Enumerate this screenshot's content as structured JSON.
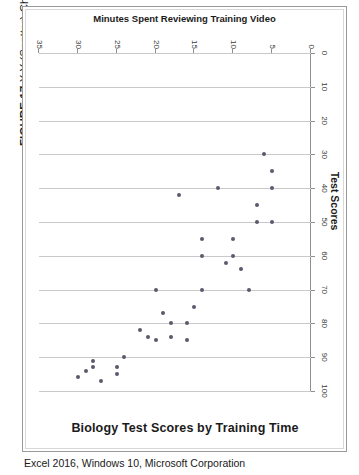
{
  "figure": {
    "label": "FIGURE 17",
    "caption": "X Y (Scatter) Chart"
  },
  "source": "Excel 2016, Windows 10, Microsoft Corporation",
  "chart_data": {
    "type": "scatter",
    "title": "Biology Test Scores by Training Time",
    "xlabel": "Test Scores",
    "ylabel": "Minutes Spent Reviewing Training Video",
    "xlim": [
      0,
      100
    ],
    "ylim": [
      0,
      35
    ],
    "xticks": [
      0,
      10,
      20,
      30,
      40,
      50,
      60,
      70,
      80,
      90,
      100
    ],
    "yticks": [
      0,
      5,
      10,
      15,
      20,
      25,
      30,
      35
    ],
    "grid": "vertical",
    "legend": "none",
    "marker": "diamond",
    "marker_color": "#5a5a6e",
    "y_axis_inverted": true,
    "points": [
      {
        "x": 30,
        "y": 6
      },
      {
        "x": 35,
        "y": 5
      },
      {
        "x": 40,
        "y": 5
      },
      {
        "x": 50,
        "y": 5
      },
      {
        "x": 45,
        "y": 7
      },
      {
        "x": 50,
        "y": 7
      },
      {
        "x": 70,
        "y": 8
      },
      {
        "x": 64,
        "y": 9
      },
      {
        "x": 55,
        "y": 10
      },
      {
        "x": 60,
        "y": 10
      },
      {
        "x": 62,
        "y": 11
      },
      {
        "x": 40,
        "y": 12
      },
      {
        "x": 55,
        "y": 14
      },
      {
        "x": 60,
        "y": 14
      },
      {
        "x": 70,
        "y": 14
      },
      {
        "x": 75,
        "y": 15
      },
      {
        "x": 80,
        "y": 16
      },
      {
        "x": 85,
        "y": 16
      },
      {
        "x": 42,
        "y": 17
      },
      {
        "x": 80,
        "y": 18
      },
      {
        "x": 84,
        "y": 18
      },
      {
        "x": 77,
        "y": 19
      },
      {
        "x": 70,
        "y": 20
      },
      {
        "x": 85,
        "y": 20
      },
      {
        "x": 84,
        "y": 21
      },
      {
        "x": 82,
        "y": 22
      },
      {
        "x": 90,
        "y": 24
      },
      {
        "x": 93,
        "y": 25
      },
      {
        "x": 95,
        "y": 25
      },
      {
        "x": 97,
        "y": 27
      },
      {
        "x": 91,
        "y": 28
      },
      {
        "x": 93,
        "y": 28
      },
      {
        "x": 94,
        "y": 29
      },
      {
        "x": 96,
        "y": 30
      }
    ]
  }
}
